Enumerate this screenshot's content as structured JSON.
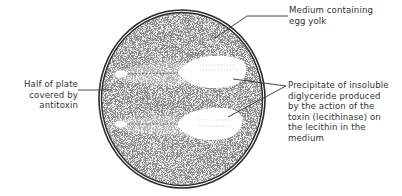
{
  "diagram": {
    "colors": {
      "plate_rim": "#2a2a2a",
      "medium_stipple": "#8a8a8a",
      "precipitate": "#ffffff",
      "leader_lines": "#333333",
      "text": "#333333"
    },
    "labels": {
      "medium": {
        "lines": [
          "Medium containing",
          "egg yolk"
        ]
      },
      "antitoxin": {
        "lines": [
          "Half of plate",
          "covered by",
          "antitoxin"
        ]
      },
      "precipitate": {
        "lines": [
          "Precipitate of insoluble",
          "diglyceride produced",
          "by the action of the",
          "toxin (lecithinase) on",
          "the lecithin in the",
          "medium"
        ]
      }
    },
    "elements": {
      "plate": {
        "shape": "circle",
        "cx": 182,
        "cy": 99,
        "rx": 83,
        "ry": 89
      },
      "streaks": [
        {
          "name": "upper-streak",
          "precipitate_center": [
            213,
            71
          ]
        },
        {
          "name": "lower-streak",
          "precipitate_center": [
            210,
            124
          ]
        }
      ]
    }
  }
}
